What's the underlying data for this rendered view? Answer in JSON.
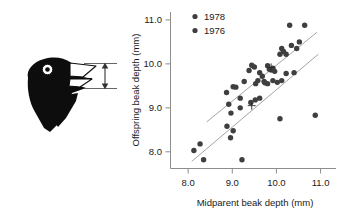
{
  "figure": {
    "caption_present": false,
    "illustration": {
      "name": "finch-head-diagram",
      "description": "darwin-finch-head-silhouette",
      "measure_annotation": "beak-depth-arrow",
      "colors": {
        "head": "#0d0d0d",
        "beak_fill": "#ffffff",
        "outline": "#0d0d0d",
        "arrow": "#3a3a3a"
      }
    }
  },
  "chart_data": {
    "type": "scatter",
    "title": "",
    "xlabel": "Midparent beak depth (mm)",
    "ylabel": "Offspring beak depth (mm)",
    "xlim": [
      7.6,
      11.35
    ],
    "ylim": [
      7.62,
      11.18
    ],
    "xticks": [
      "8.0",
      "9.0",
      "10.0",
      "11.0"
    ],
    "xtick_values": [
      8.0,
      9.0,
      10.0,
      11.0
    ],
    "yticks": [
      "8.0",
      "9.0",
      "10.0",
      "11.0"
    ],
    "ytick_values": [
      8.0,
      9.0,
      10.0,
      11.0
    ],
    "grid": false,
    "legend_position": "top-center",
    "point_color": "#3f3f3f",
    "line_color": "#9a9a9a",
    "series": [
      {
        "name": "1978",
        "label": "1978",
        "marker": "circle",
        "color": "#3f3f3f",
        "points": [
          [
            8.87,
            9.35
          ],
          [
            8.92,
            9.08
          ],
          [
            8.97,
            8.88
          ],
          [
            9.02,
            9.48
          ],
          [
            9.08,
            9.47
          ],
          [
            9.18,
            9.22
          ],
          [
            9.27,
            9.6
          ],
          [
            9.38,
            9.85
          ],
          [
            9.44,
            9.97
          ],
          [
            9.5,
            9.93
          ],
          [
            9.53,
            9.55
          ],
          [
            9.58,
            9.62
          ],
          [
            9.62,
            9.8
          ],
          [
            9.68,
            9.72
          ],
          [
            9.74,
            9.57
          ],
          [
            9.8,
            9.96
          ],
          [
            9.84,
            9.88
          ],
          [
            9.88,
            9.86
          ],
          [
            9.92,
            9.9
          ],
          [
            9.96,
            9.83
          ],
          [
            10.02,
            9.58
          ],
          [
            10.08,
            10.22
          ],
          [
            10.12,
            10.35
          ],
          [
            10.16,
            10.28
          ],
          [
            10.22,
            10.22
          ],
          [
            10.3,
            10.88
          ],
          [
            10.34,
            10.42
          ],
          [
            10.46,
            10.35
          ],
          [
            10.52,
            10.5
          ],
          [
            10.64,
            10.88
          ],
          [
            10.22,
            9.78
          ]
        ],
        "trendline": {
          "x1": 8.42,
          "y1": 8.68,
          "x2": 10.92,
          "y2": 10.72
        },
        "mean_marker": [
          9.88,
          9.92
        ]
      },
      {
        "name": "1976",
        "label": "1976",
        "marker": "circle",
        "color": "#3f3f3f",
        "points": [
          [
            8.13,
            8.03
          ],
          [
            8.27,
            8.18
          ],
          [
            8.35,
            7.82
          ],
          [
            8.88,
            8.58
          ],
          [
            8.96,
            8.32
          ],
          [
            9.02,
            8.48
          ],
          [
            9.18,
            9.0
          ],
          [
            9.22,
            7.82
          ],
          [
            9.42,
            9.12
          ],
          [
            9.52,
            9.18
          ],
          [
            9.62,
            9.22
          ],
          [
            9.72,
            9.6
          ],
          [
            9.8,
            9.55
          ],
          [
            9.92,
            9.62
          ],
          [
            10.12,
            9.62
          ],
          [
            10.08,
            8.75
          ],
          [
            10.4,
            9.8
          ],
          [
            10.88,
            8.83
          ]
        ],
        "trendline": {
          "x1": 8.08,
          "y1": 7.78,
          "x2": 10.95,
          "y2": 10.22
        },
        "mean_marker": [
          9.44,
          9.05
        ]
      }
    ],
    "legend": [
      {
        "label": "1978",
        "color": "#3f3f3f"
      },
      {
        "label": "1976",
        "color": "#3f3f3f"
      }
    ]
  }
}
